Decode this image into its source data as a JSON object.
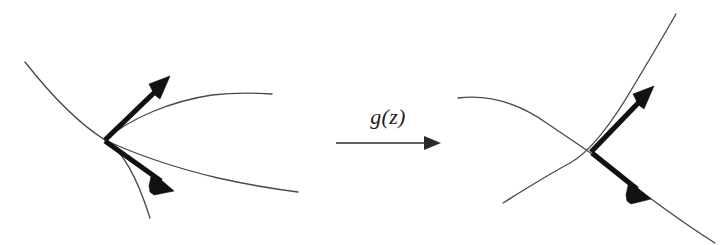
{
  "figure": {
    "background_color": "#ffffff",
    "curve_color": "#4a4a4a",
    "vector_color": "#111111",
    "label_color": "#1d1d1d",
    "width": 726,
    "height": 245
  },
  "map_label": {
    "text": "g(z)",
    "x": 388,
    "y": 124
  },
  "left_panel": {
    "name": "source-domain",
    "intersection": {
      "x": 105,
      "y": 140
    },
    "curves": [
      {
        "name": "descending-curve",
        "path": "M 25 62 C 58 104, 86 128, 105 140 C 122 151, 136 174, 150 218"
      },
      {
        "name": "upper-branch-curve",
        "path": "M 105 140 C 130 118, 172 101, 212 95 C 238 92, 258 93, 272 94"
      },
      {
        "name": "lower-branch-curve",
        "path": "M 105 140 C 135 154, 176 168, 218 178 C 254 186, 282 190, 298 192"
      }
    ],
    "vectors": [
      {
        "name": "tangent-vector-up",
        "from": {
          "x": 105,
          "y": 140
        },
        "to": {
          "x": 168,
          "y": 78
        },
        "direction": "up-right"
      },
      {
        "name": "tangent-vector-down",
        "from": {
          "x": 105,
          "y": 142
        },
        "to": {
          "x": 172,
          "y": 190
        },
        "direction": "down-right"
      }
    ]
  },
  "right_panel": {
    "name": "image-domain",
    "intersection": {
      "x": 591,
      "y": 152
    },
    "curves": [
      {
        "name": "descending-s-curve",
        "path": "M 458 98 C 490 94, 520 104, 548 124 C 570 139, 586 149, 600 160 C 632 185, 672 216, 715 243"
      },
      {
        "name": "ascending-curve",
        "path": "M 503 203 C 522 191, 546 176, 570 163 C 592 151, 614 120, 636 82 C 654 52, 668 28, 676 14"
      }
    ],
    "vectors": [
      {
        "name": "tangent-vector-up",
        "from": {
          "x": 591,
          "y": 152
        },
        "to": {
          "x": 652,
          "y": 88
        },
        "direction": "up-right"
      },
      {
        "name": "tangent-vector-down",
        "from": {
          "x": 592,
          "y": 154
        },
        "to": {
          "x": 648,
          "y": 198
        },
        "direction": "down-right"
      }
    ]
  },
  "map_arrow": {
    "name": "transform-arrow",
    "from": {
      "x": 336,
      "y": 143
    },
    "to": {
      "x": 440,
      "y": 143
    }
  }
}
